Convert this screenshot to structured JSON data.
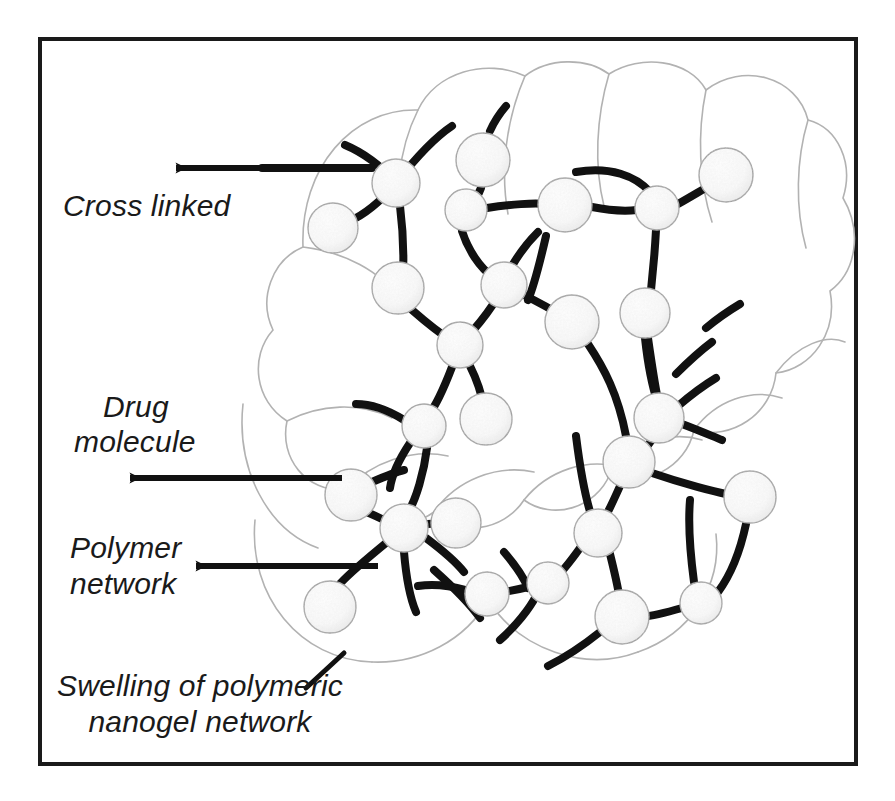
{
  "figure": {
    "background_color": "#ffffff",
    "frame": {
      "name": "figure-border",
      "color": "#1a1a1a",
      "x": 38,
      "y": 37,
      "width": 820,
      "height": 729,
      "stroke_width": 4
    }
  },
  "labels": {
    "cross_linked": {
      "line1": "Cross linked"
    },
    "drug_molecule": {
      "line1": "Drug",
      "line2": "molecule"
    },
    "polymer_network": {
      "line1": "Polymer",
      "line2": "network"
    },
    "swelling": {
      "line1": "Swelling of polymeric",
      "line2": "nanogel network"
    }
  },
  "colors": {
    "text": "#1a1a1a",
    "arrow": "#111111",
    "chain": "#111111",
    "cloud_outline": "#b0b0b0",
    "particle_fill": "#fbfbfb",
    "particle_stroke": "#9a9a9a",
    "particle_speckle": "#c9c9c9",
    "frame": "#1a1a1a"
  },
  "annotations": [
    {
      "id": "cross-linked",
      "label": "Cross linked",
      "kind": "arrow",
      "direction": "left",
      "from_x": 372,
      "from_y": 168,
      "to_x": 172,
      "to_y": 168,
      "text_x": 63,
      "text_y": 215
    },
    {
      "id": "drug-molecule",
      "label": "Drug molecule",
      "kind": "arrow",
      "direction": "left",
      "from_x": 342,
      "from_y": 478,
      "to_x": 124,
      "to_y": 478,
      "text_x": 102,
      "text_y": 412
    },
    {
      "id": "polymer-network",
      "label": "Polymer network",
      "kind": "arrow",
      "direction": "left",
      "from_x": 378,
      "from_y": 566,
      "to_x": 191,
      "to_y": 566,
      "text_x": 70,
      "text_y": 557
    },
    {
      "id": "swelling",
      "label": "Swelling of polymeric nanogel network",
      "kind": "leader-line",
      "from_x": 306,
      "from_y": 688,
      "to_x": 342,
      "to_y": 655,
      "text_x": 200,
      "text_y": 690
    }
  ],
  "network": {
    "description": "White spherical drug-molecule particles joined by thick black polymer chains inside a scalloped cloud-shaped nanogel boundary",
    "particle_count": 26,
    "particles": [
      {
        "id": "p1",
        "cx": 396,
        "cy": 183,
        "r": 24,
        "role": "cross-link-node"
      },
      {
        "id": "p2",
        "cx": 333,
        "cy": 228,
        "r": 25,
        "role": "free-drug"
      },
      {
        "id": "p3",
        "cx": 483,
        "cy": 160,
        "r": 27,
        "role": "free-drug"
      },
      {
        "id": "p4",
        "cx": 466,
        "cy": 210,
        "r": 21,
        "role": "chain-node"
      },
      {
        "id": "p5",
        "cx": 565,
        "cy": 205,
        "r": 27,
        "role": "chain-node"
      },
      {
        "id": "p6",
        "cx": 657,
        "cy": 208,
        "r": 22,
        "role": "cross-link-node"
      },
      {
        "id": "p7",
        "cx": 726,
        "cy": 175,
        "r": 27,
        "role": "chain-node"
      },
      {
        "id": "p8",
        "cx": 398,
        "cy": 288,
        "r": 26,
        "role": "free-drug"
      },
      {
        "id": "p9",
        "cx": 504,
        "cy": 285,
        "r": 23,
        "role": "cross-link-node"
      },
      {
        "id": "p10",
        "cx": 572,
        "cy": 322,
        "r": 27,
        "role": "free-drug"
      },
      {
        "id": "p11",
        "cx": 645,
        "cy": 313,
        "r": 25,
        "role": "chain-node"
      },
      {
        "id": "p12",
        "cx": 460,
        "cy": 345,
        "r": 23,
        "role": "cross-link-node"
      },
      {
        "id": "p13",
        "cx": 424,
        "cy": 426,
        "r": 22,
        "role": "chain-node"
      },
      {
        "id": "p14",
        "cx": 486,
        "cy": 419,
        "r": 26,
        "role": "free-drug"
      },
      {
        "id": "p15",
        "cx": 659,
        "cy": 418,
        "r": 25,
        "role": "cross-link-node"
      },
      {
        "id": "p16",
        "cx": 351,
        "cy": 495,
        "r": 26,
        "role": "free-drug"
      },
      {
        "id": "p17",
        "cx": 404,
        "cy": 528,
        "r": 24,
        "role": "cross-link-node"
      },
      {
        "id": "p18",
        "cx": 456,
        "cy": 523,
        "r": 25,
        "role": "free-drug"
      },
      {
        "id": "p19",
        "cx": 629,
        "cy": 462,
        "r": 26,
        "role": "chain-node"
      },
      {
        "id": "p20",
        "cx": 750,
        "cy": 497,
        "r": 26,
        "role": "chain-node"
      },
      {
        "id": "p21",
        "cx": 598,
        "cy": 533,
        "r": 24,
        "role": "cross-link-node"
      },
      {
        "id": "p22",
        "cx": 548,
        "cy": 583,
        "r": 21,
        "role": "chain-node"
      },
      {
        "id": "p23",
        "cx": 487,
        "cy": 594,
        "r": 22,
        "role": "chain-node"
      },
      {
        "id": "p24",
        "cx": 330,
        "cy": 607,
        "r": 26,
        "role": "free-drug"
      },
      {
        "id": "p25",
        "cx": 622,
        "cy": 617,
        "r": 27,
        "role": "chain-node"
      },
      {
        "id": "p26",
        "cx": 701,
        "cy": 603,
        "r": 21,
        "role": "chain-node"
      }
    ]
  }
}
